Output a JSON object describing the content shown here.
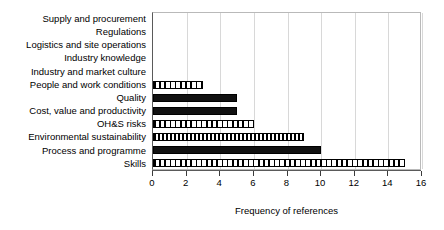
{
  "chart_data": {
    "type": "bar",
    "orientation": "horizontal",
    "title": "",
    "xlabel": "Frequency of references",
    "ylabel": "",
    "xlim": [
      0,
      16
    ],
    "xticks": [
      0,
      2,
      4,
      6,
      8,
      10,
      12,
      14,
      16
    ],
    "grid": true,
    "legend": "none",
    "categories": [
      "Supply and procurement",
      "Regulations",
      "Logistics and site operations",
      "Industry knowledge",
      "Industry and market culture",
      "People and work conditions",
      "Quality",
      "Cost, value and productivity",
      "OH&S risks",
      "Environmental sustainability",
      "Process and programme",
      "Skills"
    ],
    "values": [
      0,
      0,
      0,
      0,
      0,
      3,
      5,
      5,
      6,
      9,
      10,
      15
    ],
    "bar_styles": [
      "empty",
      "empty",
      "empty",
      "empty",
      "empty",
      "hatch",
      "solid",
      "solid",
      "hatch",
      "checker",
      "solid",
      "hatch"
    ]
  },
  "colors": {
    "bar_fill": "#111111",
    "bar_outline": "#000000",
    "gridline": "#d8d8d8",
    "axis": "#5a5a5a",
    "background": "#ffffff"
  }
}
